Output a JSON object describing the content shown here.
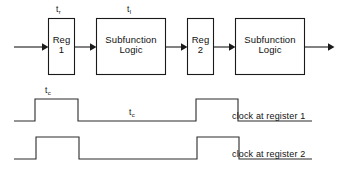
{
  "figure": {
    "type": "pipeline-timing-diagram",
    "background_color": "#ffffff",
    "line_color": "#1a1a1a"
  },
  "pipeline": {
    "stages": [
      {
        "id": "reg1",
        "line1": "Reg",
        "line2": "1",
        "timing_label": "t",
        "timing_sub": "r"
      },
      {
        "id": "logic1",
        "line1": "Subfunction",
        "line2": "Logic",
        "timing_label": "t",
        "timing_sub": "l"
      },
      {
        "id": "reg2",
        "line1": "Reg",
        "line2": "2",
        "timing_label": "",
        "timing_sub": ""
      },
      {
        "id": "logic2",
        "line1": "Subfunction",
        "line2": "Logic",
        "timing_label": "",
        "timing_sub": ""
      }
    ]
  },
  "waveforms": {
    "annotations": [
      {
        "id": "pulse-width",
        "label": "t",
        "sub": "c"
      },
      {
        "id": "clock-period",
        "label": "t",
        "sub": "c"
      }
    ],
    "traces": [
      {
        "id": "clock-register-1",
        "label": "clock at register 1"
      },
      {
        "id": "clock-register-2",
        "label": "clock at register 2"
      }
    ]
  }
}
